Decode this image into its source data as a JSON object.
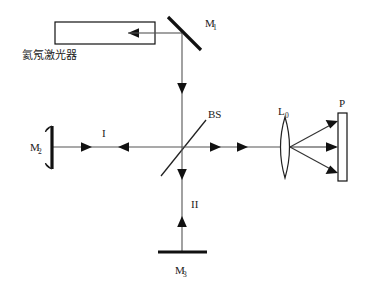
{
  "figure": {
    "width": 367,
    "height": 291,
    "background_color": "#ffffff",
    "line_color": "#555555",
    "optic_color": "#111111"
  },
  "components": {
    "laser": {
      "label": "氦氖激光器",
      "shape": "rectangle",
      "x": 55,
      "y": 22,
      "width": 100,
      "height": 22
    },
    "mirror_1": {
      "label": "M",
      "subscript": "1",
      "shape": "diagonal-thick-line",
      "orientation": "45-degree"
    },
    "mirror_2": {
      "label": "M",
      "subscript": "2",
      "shape": "vertical-thick-line",
      "orientation": "vertical"
    },
    "mirror_3": {
      "label": "M",
      "subscript": "3",
      "shape": "horizontal-thick-line",
      "orientation": "horizontal"
    },
    "beam_splitter": {
      "label": "BS",
      "shape": "diagonal-thin-line",
      "orientation": "45-degree"
    },
    "lens": {
      "label": "L",
      "subscript": "0",
      "shape": "biconvex-lens"
    },
    "screen": {
      "label": "P",
      "shape": "tall-rectangle"
    }
  },
  "beam_labels": {
    "arm_one": "I",
    "arm_two": "II"
  }
}
